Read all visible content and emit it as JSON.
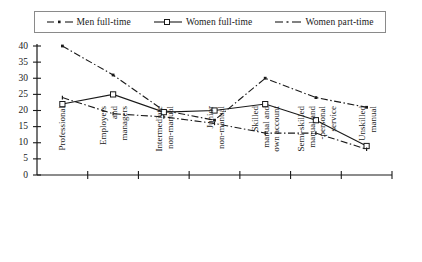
{
  "chart_data": {
    "type": "line",
    "title": "",
    "subtitle": "",
    "xlabel": "",
    "ylabel": "",
    "ylim": [
      0,
      40
    ],
    "yticks": [
      0,
      5,
      10,
      15,
      20,
      25,
      30,
      35,
      40
    ],
    "grid": false,
    "legend_position": "top",
    "categories": [
      "Professional",
      "Employers and managers",
      "Intermediate non-manual",
      "Junior non-manual",
      "Skilled manual and own account",
      "Semi-skilled manual and -personal service",
      "Unskilled manual"
    ],
    "category_lines": [
      [
        "Professional"
      ],
      [
        "Employers",
        "and",
        "managers"
      ],
      [
        "Intermediate",
        "non-manual"
      ],
      [
        "Junior",
        "non-manual"
      ],
      [
        "Skilled",
        "manual and",
        "own account"
      ],
      [
        "Semi-skilled",
        "manual and",
        "-personal",
        "service"
      ],
      [
        "Unskilled",
        "manual"
      ]
    ],
    "series": [
      {
        "name": "Men full-time",
        "marker": "dot",
        "dash": "dash-dot",
        "color": "#1a1a1a",
        "values": [
          40,
          31,
          20,
          17,
          30,
          24,
          21
        ]
      },
      {
        "name": "Women full-time",
        "marker": "square",
        "dash": "solid",
        "color": "#1a1a1a",
        "values": [
          22,
          25,
          19.5,
          20,
          22,
          17,
          9
        ]
      },
      {
        "name": "Women part-time",
        "marker": "tick",
        "dash": "dash-dot",
        "color": "#1a1a1a",
        "values": [
          24,
          19,
          18,
          16,
          13,
          13,
          8
        ]
      }
    ]
  },
  "legend": {
    "items": [
      {
        "label": "Men full-time",
        "marker": "dash-dot-line-with-dot"
      },
      {
        "label": "Women full-time",
        "marker": "line-with-open-square"
      },
      {
        "label": "Women part-time",
        "marker": "dash-dot-line"
      }
    ]
  },
  "axis": {
    "y_tick_labels": [
      "40",
      "35",
      "30",
      "25",
      "20",
      "15",
      "10",
      "5",
      "0"
    ]
  }
}
